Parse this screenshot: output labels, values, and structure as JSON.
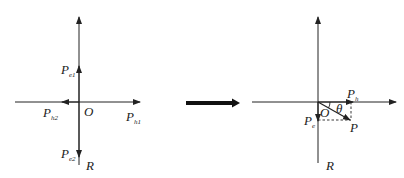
{
  "left_diagram": {
    "labels": {
      "pe1": {
        "main": "P",
        "sub": "e1"
      },
      "ph2": {
        "main": "P",
        "sub": "h2"
      },
      "origin": "O",
      "ph1": {
        "main": "P",
        "sub": "h1"
      },
      "pe2": {
        "main": "P",
        "sub": "e2"
      },
      "r": "R"
    }
  },
  "transition_arrow": {
    "direction": "right"
  },
  "right_diagram": {
    "labels": {
      "ph": {
        "main": "P",
        "sub": "h"
      },
      "theta": "θ",
      "origin": "O",
      "pe": {
        "main": "P",
        "sub": "e"
      },
      "p": "P",
      "r": "R"
    }
  },
  "colors": {
    "stroke": "#222222",
    "background": "#ffffff"
  }
}
